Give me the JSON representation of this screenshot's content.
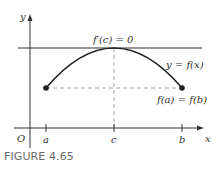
{
  "figure": {
    "caption": "FIGURE 4.65",
    "axes": {
      "x_label": "x",
      "y_label": "y",
      "origin_label": "O"
    },
    "ticks": {
      "a": "a",
      "c": "c",
      "b": "b"
    },
    "annotations": {
      "tangent": "f′(c) = 0",
      "curve": "y = f(x)",
      "endpoints": "f(a) = f(b)"
    },
    "colors": {
      "ink": "#333333",
      "dashed": "#999999",
      "caption": "#6b6b6b"
    }
  }
}
